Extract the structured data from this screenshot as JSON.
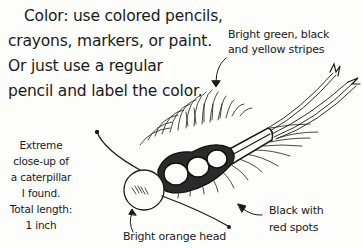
{
  "intro_text": {
    "line1": "Color: use colored pencils,",
    "line2": "crayons, markers, or paint.",
    "line3": "Or just use a regular",
    "line4": "pencil and label the color."
  },
  "annotations": {
    "stripes": {
      "line1": "Bright green, black",
      "line2": "and yellow stripes"
    },
    "closeup": {
      "line1": "Extreme",
      "line2": "close-up of",
      "line3": "a caterpillar",
      "line4": "I found.",
      "line5": "Total length:",
      "line6": "1 inch"
    },
    "head": {
      "line1": "Bright orange head"
    },
    "spots": {
      "line1": "Black with",
      "line2": "red spots"
    }
  },
  "illustration": {
    "subject": "caterpillar-sketch",
    "ink_color": "#1a1a1a",
    "paper_color": "#fdfdfc"
  }
}
